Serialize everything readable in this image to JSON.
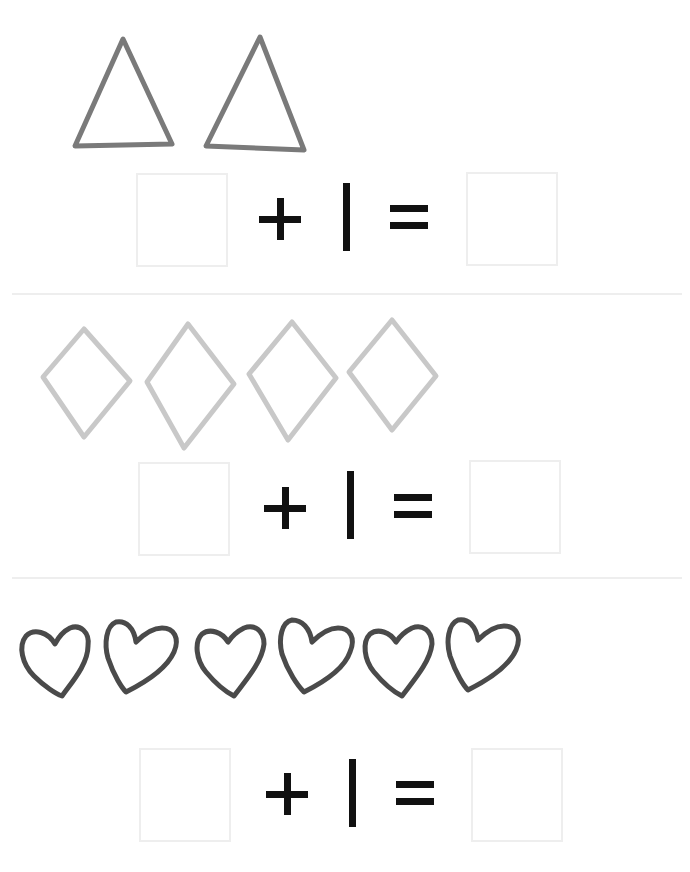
{
  "worksheet": {
    "rows": [
      {
        "shape": "triangle",
        "count": 2,
        "stroke_color": "#7a7a7a",
        "equation": {
          "left_box": "",
          "operator": "+",
          "addend": "1",
          "equals": "=",
          "right_box": ""
        }
      },
      {
        "shape": "diamond",
        "count": 4,
        "stroke_color": "#c8c8c8",
        "equation": {
          "left_box": "",
          "operator": "+",
          "addend": "1",
          "equals": "=",
          "right_box": ""
        }
      },
      {
        "shape": "heart",
        "count": 6,
        "stroke_color": "#4a4a4a",
        "equation": {
          "left_box": "",
          "operator": "+",
          "addend": "1",
          "equals": "=",
          "right_box": ""
        }
      }
    ],
    "colors": {
      "background": "#ffffff",
      "symbol": "#111111",
      "box_border": "#eeeeee",
      "divider": "#eeeeee"
    }
  }
}
